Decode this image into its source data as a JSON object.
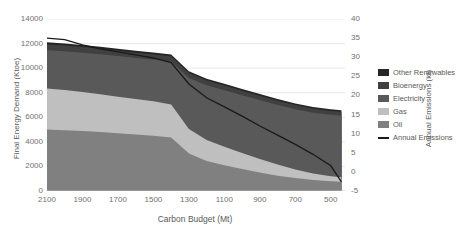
{
  "chart_data": {
    "type": "area",
    "title": "",
    "xlabel": "Carbon Budget (Mt)",
    "ylabel": "Final Energy Demand (Ktoe)",
    "y2label": "Annual Emissions (kt)",
    "grid": true,
    "legend_position": "right",
    "xlim": [
      2100,
      420
    ],
    "xticks": [
      "2100",
      "1900",
      "1700",
      "1500",
      "1300",
      "1100",
      "900",
      "700",
      "500"
    ],
    "xtick_values": [
      2100,
      1900,
      1700,
      1500,
      1300,
      1100,
      900,
      700,
      500
    ],
    "ylim": [
      0,
      14000
    ],
    "yticks": [
      "0",
      "2000",
      "4000",
      "6000",
      "8000",
      "10000",
      "12000",
      "14000"
    ],
    "ytick_values": [
      0,
      2000,
      4000,
      6000,
      8000,
      10000,
      12000,
      14000
    ],
    "y2lim": [
      -5,
      40
    ],
    "y2ticks": [
      "-5",
      "0",
      "5",
      "10",
      "15",
      "20",
      "25",
      "30",
      "35",
      "40"
    ],
    "y2tick_values": [
      -5,
      0,
      5,
      10,
      15,
      20,
      25,
      30,
      35,
      40
    ],
    "x": [
      2100,
      2000,
      1900,
      1800,
      1700,
      1600,
      1500,
      1400,
      1300,
      1200,
      1100,
      1000,
      900,
      800,
      700,
      600,
      500,
      440
    ],
    "series": [
      {
        "name": "Oil",
        "color": "#808080",
        "values": [
          5000,
          4950,
          4880,
          4800,
          4700,
          4600,
          4500,
          4350,
          3050,
          2450,
          2100,
          1800,
          1500,
          1250,
          1050,
          900,
          800,
          760
        ]
      },
      {
        "name": "Gas",
        "color": "#BFBFBF",
        "values": [
          3350,
          3280,
          3180,
          3080,
          2980,
          2880,
          2800,
          2700,
          2000,
          1700,
          1500,
          1300,
          1100,
          900,
          700,
          520,
          400,
          350
        ]
      },
      {
        "name": "Electricity",
        "color": "#595959",
        "values": [
          3100,
          3150,
          3200,
          3250,
          3300,
          3350,
          3400,
          3500,
          4150,
          4450,
          4600,
          4700,
          4800,
          4850,
          4900,
          4950,
          5000,
          5020
        ]
      },
      {
        "name": "Bioenergy",
        "color": "#404040",
        "values": [
          480,
          470,
          460,
          450,
          440,
          430,
          420,
          410,
          400,
          390,
          380,
          370,
          360,
          350,
          340,
          330,
          320,
          315
        ]
      },
      {
        "name": "Other Renewables",
        "color": "#262626",
        "values": [
          170,
          165,
          160,
          158,
          155,
          152,
          150,
          148,
          145,
          142,
          140,
          138,
          136,
          134,
          132,
          130,
          128,
          126
        ]
      }
    ],
    "line_series": {
      "name": "Annual Emissions",
      "color": "#1A1A1A",
      "axis": "right",
      "values": [
        35.0,
        34.6,
        33.2,
        32.2,
        31.4,
        30.6,
        29.8,
        28.6,
        23.0,
        19.4,
        17.0,
        14.6,
        12.0,
        9.6,
        7.2,
        4.6,
        1.6,
        -2.6
      ]
    }
  },
  "legend": {
    "items": [
      {
        "label": "Other Renewables",
        "marker": "swatch"
      },
      {
        "label": "Bioenergy",
        "marker": "swatch"
      },
      {
        "label": "Electricity",
        "marker": "swatch"
      },
      {
        "label": "Gas",
        "marker": "swatch"
      },
      {
        "label": "Oil",
        "marker": "swatch"
      },
      {
        "label": "Annual Emissions",
        "marker": "line"
      }
    ]
  },
  "colors": {
    "other_renewables": "#262626",
    "bioenergy": "#404040",
    "electricity": "#595959",
    "gas": "#BFBFBF",
    "oil": "#808080",
    "annual_emissions": "#1A1A1A",
    "grid": "#D9D9D9",
    "text": "#595959"
  }
}
